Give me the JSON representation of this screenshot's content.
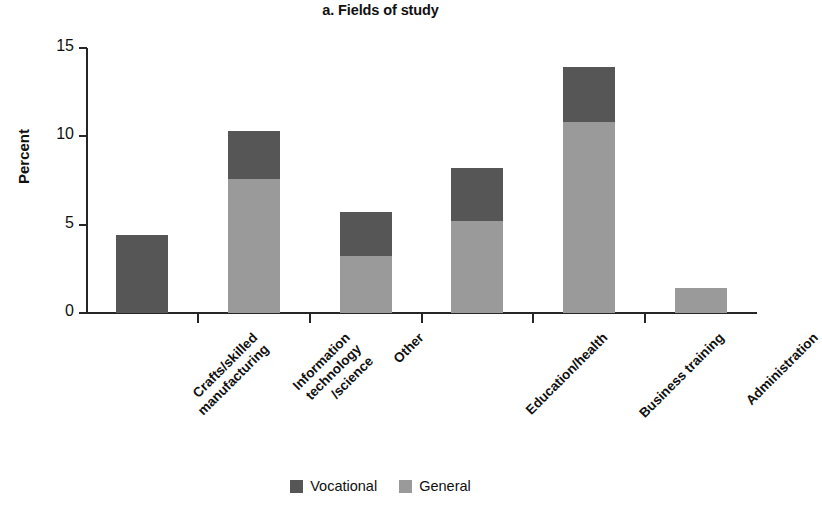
{
  "chart_data": {
    "type": "bar",
    "subtype": "stacked",
    "title": "a. Fields of study",
    "xlabel": "",
    "ylabel": "Percent",
    "ylim": [
      0,
      15
    ],
    "yticks": [
      0,
      5,
      10,
      15
    ],
    "ytick_labels": [
      "0",
      "5",
      "10",
      "15"
    ],
    "grid": false,
    "legend_position": "bottom-center",
    "categories": [
      "Crafts/skilled\nmanufacturing",
      "Information\ntechnology\n/science",
      "Other",
      "Education/health",
      "Business training",
      "Administration"
    ],
    "series": [
      {
        "name": "General",
        "color": "#9a9a9a",
        "values": [
          0.0,
          7.6,
          3.2,
          5.2,
          10.8,
          1.4
        ]
      },
      {
        "name": "Vocational",
        "color": "#565656",
        "values": [
          4.4,
          2.7,
          2.5,
          3.0,
          3.1,
          0.0
        ]
      }
    ],
    "totals": [
      4.4,
      10.3,
      5.7,
      8.2,
      13.9,
      1.4
    ],
    "annotations": []
  },
  "legend": {
    "items": [
      {
        "label": "Vocational",
        "color": "#565656"
      },
      {
        "label": "General",
        "color": "#9a9a9a"
      }
    ]
  },
  "colors": {
    "vocational": "#565656",
    "general": "#9a9a9a",
    "axis": "#262626",
    "text": "#101010",
    "background": "#ffffff"
  }
}
